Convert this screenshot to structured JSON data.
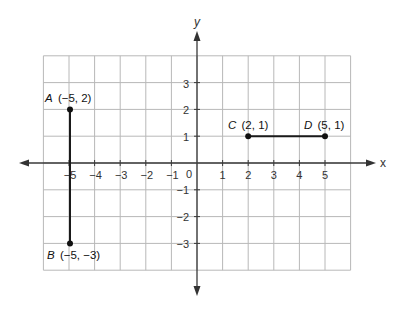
{
  "chart_data": {
    "type": "scatter",
    "title": "",
    "xlabel": "x",
    "ylabel": "y",
    "xlim": [
      -6,
      6
    ],
    "ylim": [
      -4,
      4
    ],
    "grid": true,
    "x_ticks": [
      -5,
      -4,
      -3,
      -2,
      -1,
      1,
      2,
      3,
      4,
      5
    ],
    "y_ticks": [
      3,
      2,
      1,
      -1,
      -2,
      -3
    ],
    "origin_label": "0",
    "points": [
      {
        "name": "A",
        "x": -5,
        "y": 2,
        "label": "(−5, 2)"
      },
      {
        "name": "B",
        "x": -5,
        "y": -3,
        "label": "(−5, −3)"
      },
      {
        "name": "C",
        "x": 2,
        "y": 1,
        "label": "(2, 1)"
      },
      {
        "name": "D",
        "x": 5,
        "y": 1,
        "label": "(5, 1)"
      }
    ],
    "segments": [
      {
        "from": "A",
        "to": "B"
      },
      {
        "from": "C",
        "to": "D"
      }
    ]
  },
  "labels": {
    "x_axis": "x",
    "y_axis": "y",
    "origin": "0",
    "x_ticks": [
      "−5",
      "−4",
      "−3",
      "−2",
      "−1",
      "1",
      "2",
      "3",
      "4",
      "5"
    ],
    "y_ticks_pos": [
      "3",
      "2",
      "1"
    ],
    "y_ticks_neg": [
      "−1",
      "−2",
      "−3"
    ],
    "point_A_name": "A",
    "point_A_coords": "(−5, 2)",
    "point_B_name": "B",
    "point_B_coords": "(−5, −3)",
    "point_C_name": "C",
    "point_C_coords": "(2, 1)",
    "point_D_name": "D",
    "point_D_coords": "(5, 1)"
  }
}
